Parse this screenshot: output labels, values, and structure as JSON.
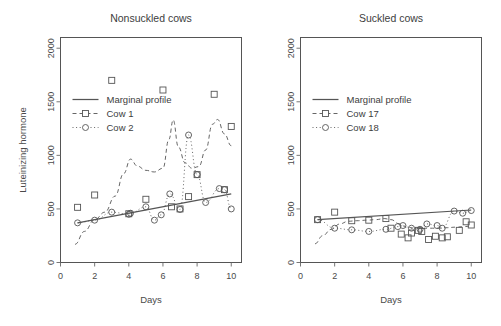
{
  "figure": {
    "background": "#ffffff",
    "axis_color": "#555555",
    "text_color": "#3d3d3d",
    "series_color": "#555555",
    "panels": 2
  },
  "chart_data": [
    {
      "type": "scatter",
      "title": "Nonsuckled cows",
      "xlabel": "Days",
      "ylabel": "Luteinizing hormone",
      "xlim": [
        0,
        10.6
      ],
      "ylim": [
        0,
        2100
      ],
      "xticks": [
        0,
        2,
        4,
        6,
        8,
        10
      ],
      "yticks": [
        0,
        500,
        1000,
        1500,
        2000
      ],
      "grid": false,
      "legend_position": "top-left",
      "legend": [
        "Marginal profile",
        "Cow 1",
        "Cow 2"
      ],
      "series": [
        {
          "name": "Marginal profile",
          "style": "solid-line",
          "marker": "none",
          "x": [
            1.0,
            10.0
          ],
          "values": [
            370,
            640
          ]
        },
        {
          "name": "Cow 1",
          "style": "dashed-line",
          "marker": "square",
          "x": [
            1.0,
            2.0,
            3.0,
            4.0,
            5.0,
            6.0,
            6.5,
            7.0,
            7.5,
            8.0,
            9.0,
            9.6,
            10.0
          ],
          "values": [
            515,
            630,
            1700,
            455,
            590,
            1610,
            520,
            500,
            615,
            820,
            1570,
            680,
            1270
          ],
          "smooth_x": [
            0.85,
            1.4,
            2.0,
            2.6,
            3.2,
            3.7,
            4.1,
            4.5,
            5.0,
            5.5,
            6.0,
            6.35,
            6.6,
            6.9,
            7.3,
            7.7,
            8.1,
            8.5,
            8.9,
            9.2,
            9.6,
            10.0
          ],
          "smooth_values": [
            170,
            290,
            400,
            470,
            620,
            830,
            965,
            900,
            860,
            845,
            880,
            1150,
            1330,
            1080,
            930,
            880,
            895,
            1050,
            1290,
            1335,
            1200,
            1090
          ]
        },
        {
          "name": "Cow 2",
          "style": "dotted-line",
          "marker": "circle",
          "x": [
            1.0,
            2.0,
            3.0,
            4.0,
            4.1,
            5.0,
            5.5,
            5.9,
            6.4,
            7.0,
            7.5,
            8.0,
            8.5,
            9.3,
            9.6,
            10.0
          ],
          "values": [
            370,
            395,
            470,
            450,
            460,
            520,
            395,
            445,
            640,
            495,
            1190,
            820,
            560,
            690,
            680,
            500
          ]
        }
      ]
    },
    {
      "type": "scatter",
      "title": "Suckled cows",
      "xlabel": "Days",
      "ylabel": "",
      "xlim": [
        0,
        10.6
      ],
      "ylim": [
        0,
        2100
      ],
      "xticks": [
        0,
        2,
        4,
        6,
        8,
        10
      ],
      "yticks": [
        0,
        500,
        1000,
        1500,
        2000
      ],
      "grid": false,
      "legend_position": "top-left",
      "legend": [
        "Marginal profile",
        "Cow 17",
        "Cow 18"
      ],
      "series": [
        {
          "name": "Marginal profile",
          "style": "solid-line",
          "marker": "none",
          "x": [
            1.0,
            10.0
          ],
          "values": [
            400,
            490
          ]
        },
        {
          "name": "Cow 17",
          "style": "dashed-line",
          "marker": "square",
          "x": [
            1.0,
            2.0,
            3.0,
            4.0,
            5.0,
            5.3,
            5.9,
            6.3,
            6.5,
            6.9,
            7.1,
            7.5,
            7.9,
            8.3,
            8.6,
            9.3,
            9.7,
            10.0
          ],
          "values": [
            400,
            470,
            390,
            395,
            410,
            320,
            265,
            230,
            275,
            300,
            290,
            215,
            245,
            230,
            240,
            300,
            380,
            350
          ],
          "smooth_x": [
            0.85,
            1.3,
            1.8,
            2.3,
            2.8,
            3.3,
            3.9,
            4.4,
            4.9,
            5.3,
            5.8,
            6.2,
            6.7,
            7.1,
            7.6,
            8.1,
            8.6,
            9.1,
            9.6,
            10.0
          ],
          "smooth_values": [
            175,
            250,
            310,
            360,
            385,
            390,
            395,
            400,
            410,
            400,
            360,
            330,
            320,
            320,
            320,
            320,
            325,
            330,
            335,
            340
          ]
        },
        {
          "name": "Cow 18",
          "style": "dotted-line",
          "marker": "circle",
          "x": [
            1.0,
            2.0,
            3.0,
            4.0,
            5.0,
            5.7,
            6.0,
            6.5,
            7.0,
            7.4,
            8.0,
            8.3,
            9.0,
            9.5,
            10.0
          ],
          "values": [
            400,
            320,
            305,
            290,
            310,
            335,
            345,
            320,
            310,
            360,
            345,
            320,
            480,
            460,
            485
          ]
        }
      ]
    }
  ]
}
